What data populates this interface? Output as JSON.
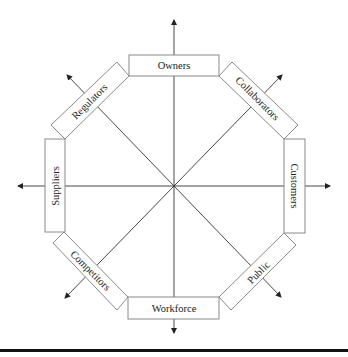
{
  "diagram": {
    "type": "stakeholder-octagon",
    "center": [
      174,
      186
    ],
    "stakeholders": [
      {
        "id": "owners",
        "label": "Owners",
        "position": "top"
      },
      {
        "id": "collaborators",
        "label": "Collaborators",
        "position": "top-right"
      },
      {
        "id": "customers",
        "label": "Customers",
        "position": "right"
      },
      {
        "id": "public",
        "label": "Public",
        "position": "bottom-right"
      },
      {
        "id": "workforce",
        "label": "Workforce",
        "position": "bottom"
      },
      {
        "id": "competitors",
        "label": "Competitors",
        "position": "bottom-left"
      },
      {
        "id": "suppliers",
        "label": "Suppliers",
        "position": "left"
      },
      {
        "id": "regulators",
        "label": "Regulators",
        "position": "top-left"
      }
    ],
    "colors": {
      "line": "#333333",
      "box_border": "#8a8a8a",
      "text": "#222222",
      "bar": "#111111"
    }
  }
}
